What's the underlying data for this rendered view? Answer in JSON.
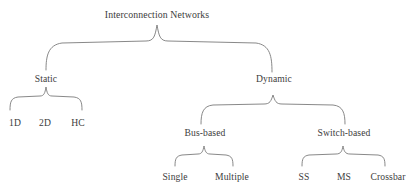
{
  "diagram": {
    "title": "Interconnection Networks",
    "type": "taxonomy-tree",
    "connector_style": "curly-brace",
    "line_color": "#7a7a7a",
    "text_color": "#3c3c3c",
    "background_color": "#ffffff",
    "root": {
      "label": "Interconnection Networks",
      "x": 157,
      "y": 10
    },
    "level_one": [
      {
        "name": "static-node",
        "label": "Static",
        "x": 46,
        "y": 74
      },
      {
        "name": "dynamic-node",
        "label": "Dynamic",
        "x": 274,
        "y": 74
      }
    ],
    "level_two": [
      {
        "name": "one-d-node",
        "label": "1D",
        "x": 15,
        "y": 118
      },
      {
        "name": "two-d-node",
        "label": "2D",
        "x": 45,
        "y": 118
      },
      {
        "name": "hc-node",
        "label": "HC",
        "x": 78,
        "y": 118
      },
      {
        "name": "bus-based-node",
        "label": "Bus-based",
        "x": 205,
        "y": 128
      },
      {
        "name": "switch-based-node",
        "label": "Switch-based",
        "x": 344,
        "y": 128
      }
    ],
    "level_three": [
      {
        "name": "single-node",
        "label": "Single",
        "x": 175,
        "y": 172
      },
      {
        "name": "multiple-node",
        "label": "Multiple",
        "x": 232,
        "y": 172
      },
      {
        "name": "ss-node",
        "label": "SS",
        "x": 304,
        "y": 172
      },
      {
        "name": "ms-node",
        "label": "MS",
        "x": 344,
        "y": 172
      },
      {
        "name": "crossbar-node",
        "label": "Crossbar",
        "x": 388,
        "y": 172
      }
    ]
  }
}
